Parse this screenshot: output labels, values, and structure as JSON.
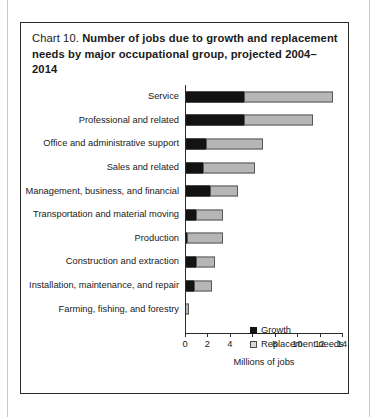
{
  "chart_box": {
    "title_label": "Chart 10.",
    "title_main": "Number of jobs due to growth and replacement needs by major occupational group, projected 2004–2014"
  },
  "legend": {
    "growth_label": "Growth",
    "replacement_label": "Replacement needs"
  },
  "colors": {
    "growth": "#131313",
    "replacement": "#b6b6b6",
    "border": "#2b2b2b",
    "background": "#ffffff"
  },
  "chart_data": {
    "type": "bar",
    "orientation": "horizontal",
    "stacked": true,
    "title": "Chart 10. Number of jobs due to growth and replacement needs by major occupational group, projected 2004–2014",
    "xlabel": "Millions of jobs",
    "ylabel": "",
    "xlim": [
      0,
      14
    ],
    "xticks": [
      0,
      2,
      4,
      6,
      8,
      10,
      12,
      14
    ],
    "xtick_labels": [
      "0",
      "2",
      "4",
      "6",
      "8",
      "10",
      "12",
      "14"
    ],
    "grid": false,
    "legend_position": "inside-right",
    "categories": [
      "Service",
      "Professional and related",
      "Office and administrative support",
      "Sales and related",
      "Management, business, and financial",
      "Transportation and material moving",
      "Production",
      "Construction and extraction",
      "Installation, maintenance, and repair",
      "Farming, fishing, and forestry"
    ],
    "series": [
      {
        "name": "Growth",
        "values": [
          5.3,
          5.3,
          1.9,
          1.6,
          2.2,
          1.0,
          0.1,
          1.0,
          0.8,
          0.0
        ]
      },
      {
        "name": "Replacement needs",
        "values": [
          7.9,
          6.1,
          5.1,
          4.6,
          2.5,
          2.4,
          3.2,
          1.7,
          1.6,
          0.4
        ]
      }
    ],
    "totals": [
      13.2,
      11.4,
      7.0,
      6.2,
      4.7,
      3.4,
      3.3,
      2.7,
      2.4,
      0.4
    ]
  }
}
